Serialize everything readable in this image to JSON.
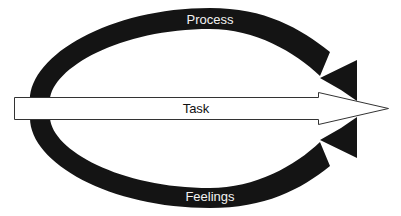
{
  "diagram": {
    "type": "cycle-arrows",
    "labels": {
      "top_arc": "Process",
      "center_arrow": "Task",
      "bottom_arc": "Feelings"
    },
    "colors": {
      "arc_fill": "#141414",
      "arc_label": "#f2f2f2",
      "task_fill": "#ffffff",
      "task_stroke": "#333333",
      "task_label": "#111111",
      "background": "#ffffff"
    },
    "nodes": [
      {
        "id": "process",
        "label": "Process",
        "shape": "curved-arrow",
        "direction": "left-to-right over top"
      },
      {
        "id": "task",
        "label": "Task",
        "shape": "block-arrow",
        "direction": "left-to-right"
      },
      {
        "id": "feelings",
        "label": "Feelings",
        "shape": "curved-arrow",
        "direction": "left-to-right under bottom"
      }
    ]
  }
}
